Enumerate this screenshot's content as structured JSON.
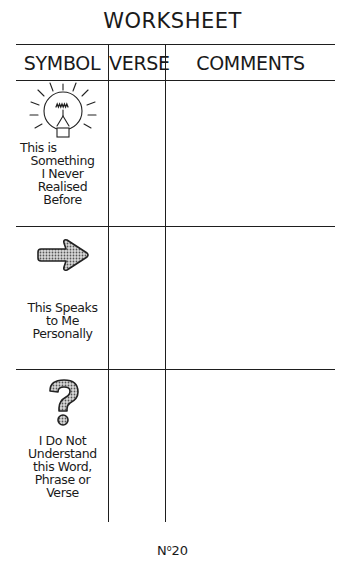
{
  "document": {
    "title": "WORKSHEET",
    "columns": [
      "SYMBOL",
      "VERSE",
      "COMMENTS"
    ],
    "rows": [
      {
        "icon": "lightbulb-icon",
        "label_lines": [
          "This is",
          "Something",
          "I Never",
          "Realised",
          "Before"
        ],
        "verse": "",
        "comments": ""
      },
      {
        "icon": "arrow-right-icon",
        "label_lines": [
          "This Speaks",
          "to Me",
          "Personally"
        ],
        "verse": "",
        "comments": ""
      },
      {
        "icon": "question-mark-icon",
        "label_lines": [
          "I Do Not",
          "Understand",
          "this Word,",
          "Phrase or",
          "Verse"
        ],
        "verse": "",
        "comments": ""
      }
    ],
    "page_number": {
      "prefix": "N",
      "ordinal": "o",
      "value": "20"
    }
  }
}
